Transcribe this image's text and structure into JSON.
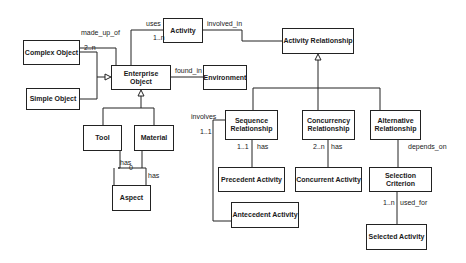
{
  "diagram": {
    "type": "UML class diagram",
    "classes": [
      {
        "id": "complex_object",
        "label": "Complex Object"
      },
      {
        "id": "simple_object",
        "label": "Simple Object"
      },
      {
        "id": "enterprise_object",
        "label": "Enterprise Object"
      },
      {
        "id": "activity",
        "label": "Activity"
      },
      {
        "id": "environment",
        "label": "Environment"
      },
      {
        "id": "activity_relationship",
        "label": "Activity Relationship"
      },
      {
        "id": "tool",
        "label": "Tool"
      },
      {
        "id": "material",
        "label": "Material"
      },
      {
        "id": "aspect",
        "label": "Aspect"
      },
      {
        "id": "sequence_relationship",
        "label_line1": "Sequence",
        "label_line2": "Relationship"
      },
      {
        "id": "concurrency_relationship",
        "label_line1": "Concurrency",
        "label_line2": "Relationship"
      },
      {
        "id": "alternative_relationship",
        "label_line1": "Alternative",
        "label_line2": "Relationship"
      },
      {
        "id": "precedent_activity",
        "label": "Precedent Activity"
      },
      {
        "id": "concurrent_activity",
        "label": "Concurrent Activity"
      },
      {
        "id": "selection_criterion",
        "label": "Selection Criterion"
      },
      {
        "id": "antecedent_activity",
        "label": "Antecedent Activity"
      },
      {
        "id": "selected_activity",
        "label": "Selected Activity"
      }
    ],
    "associations": [
      {
        "from": "complex_object",
        "to": "enterprise_object",
        "label": "made_up_of",
        "multiplicity": "2..n"
      },
      {
        "from": "enterprise_object",
        "to": "activity",
        "label": "uses",
        "multiplicity": "1..n"
      },
      {
        "from": "activity",
        "to": "activity_relationship",
        "label": "involved_in"
      },
      {
        "from": "enterprise_object",
        "to": "environment",
        "label": "found_in"
      },
      {
        "from": "tool",
        "to": "aspect",
        "label": "has"
      },
      {
        "from": "material",
        "to": "aspect",
        "label": "has"
      },
      {
        "from": "sequence_relationship",
        "to": "antecedent_activity",
        "label": "involves",
        "multiplicity": "1..1"
      },
      {
        "from": "sequence_relationship",
        "to": "precedent_activity",
        "label": "has",
        "multiplicity": "1..1"
      },
      {
        "from": "concurrency_relationship",
        "to": "concurrent_activity",
        "label": "has",
        "multiplicity": "2..n"
      },
      {
        "from": "alternative_relationship",
        "to": "selection_criterion",
        "label": "depends_on"
      },
      {
        "from": "selection_criterion",
        "to": "selected_activity",
        "label": "used_for",
        "multiplicity": "1..n"
      }
    ],
    "generalizations": [
      {
        "parent": "enterprise_object",
        "children": [
          "complex_object",
          "simple_object"
        ]
      },
      {
        "parent": "enterprise_object",
        "children": [
          "tool",
          "material"
        ]
      },
      {
        "parent": "activity_relationship",
        "children": [
          "sequence_relationship",
          "concurrency_relationship",
          "alternative_relationship"
        ]
      }
    ],
    "labels": {
      "made_up_of": "made_up_of",
      "mult_2n_top": "2..n",
      "uses": "uses",
      "mult_1n_activity": "1..n",
      "involved_in": "involved_in",
      "found_in": "found_in",
      "has_tool": "has",
      "has_material": "has",
      "aspect_mult": "0",
      "involves": "involves",
      "mult_11_involves": "1..1",
      "mult_11_has": "1..1",
      "has_seq": "has",
      "mult_2n_conc": "2..n",
      "has_conc": "has",
      "depends_on": "depends_on",
      "mult_1n_used": "1..n",
      "used_for": "used_for"
    }
  }
}
